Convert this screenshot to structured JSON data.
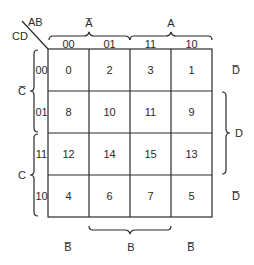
{
  "corner": {
    "col_vars": "AB",
    "row_vars": "CD"
  },
  "col_groups": [
    {
      "label": "A",
      "negated": true,
      "text": "A̅"
    },
    {
      "label": "A",
      "negated": false,
      "text": "A"
    }
  ],
  "col_headers": [
    "00",
    "01",
    "11",
    "10"
  ],
  "row_headers": [
    "00",
    "01",
    "11",
    "10"
  ],
  "row_groups_left": [
    {
      "label": "C",
      "negated": true,
      "text": "C̅"
    },
    {
      "label": "C",
      "negated": false,
      "text": "C"
    }
  ],
  "row_labels_right": {
    "d_bar_top": "D̅",
    "d": "D",
    "d_bar_bottom": "D̅"
  },
  "bottom_labels": {
    "b_bar_left": "B̅",
    "b": "B",
    "b_bar_right": "B̅"
  },
  "cells": [
    [
      "0",
      "2",
      "3",
      "1"
    ],
    [
      "8",
      "10",
      "11",
      "9"
    ],
    [
      "12",
      "14",
      "15",
      "13"
    ],
    [
      "4",
      "6",
      "7",
      "5"
    ]
  ],
  "colors": {
    "line": "#2a2a2a",
    "background": "#ffffff"
  }
}
